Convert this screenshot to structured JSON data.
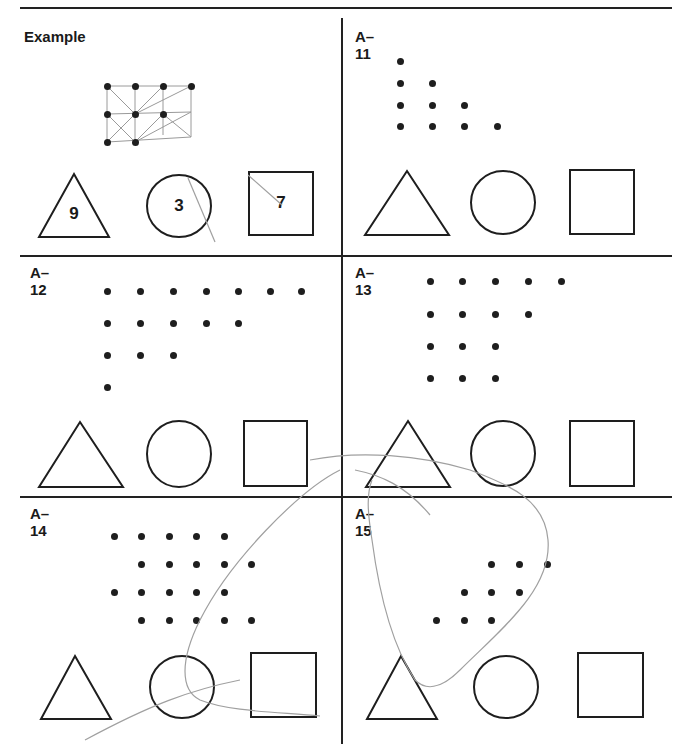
{
  "worksheet": {
    "panels": [
      {
        "id": "example",
        "label": "Example",
        "rows": [
          4,
          3,
          2
        ],
        "answers": {
          "triangle": "9",
          "circle": "3",
          "square": "7"
        }
      },
      {
        "id": "A-11",
        "label": "A–11",
        "rows": [
          1,
          2,
          3,
          4
        ],
        "answers": {
          "triangle": "",
          "circle": "",
          "square": ""
        }
      },
      {
        "id": "A-12",
        "label": "A–12",
        "rows": [
          7,
          5,
          3,
          1
        ],
        "answers": {
          "triangle": "",
          "circle": "",
          "square": ""
        }
      },
      {
        "id": "A-13",
        "label": "A–13",
        "rows": [
          5,
          4,
          3,
          3
        ],
        "answers": {
          "triangle": "",
          "circle": "",
          "square": ""
        }
      },
      {
        "id": "A-14",
        "label": "A–14",
        "rows": [
          5,
          5,
          5,
          5
        ],
        "row_offsets": [
          0,
          1,
          0,
          1
        ],
        "answers": {
          "triangle": "",
          "circle": "",
          "square": ""
        }
      },
      {
        "id": "A-15",
        "label": "A–15",
        "rows": [
          3,
          3,
          3
        ],
        "row_offsets": [
          2,
          1,
          0
        ],
        "answers": {
          "triangle": "",
          "circle": "",
          "square": ""
        }
      }
    ],
    "shape_names": [
      "triangle",
      "circle",
      "square"
    ],
    "colors": {
      "ink": "#1e1e1e",
      "pencil": "#9a9a9a",
      "paper": "#ffffff"
    }
  }
}
